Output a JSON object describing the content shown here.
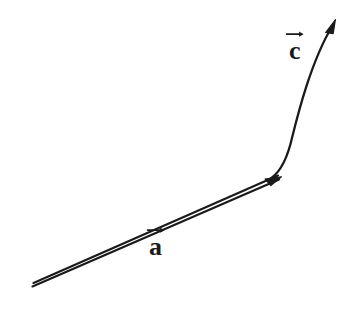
{
  "figure": {
    "background_color": "#ffffff",
    "stroke_color": "#1a1a1a",
    "labels": {
      "vector_a": "a",
      "vector_c": "c",
      "vector_a_full": "a⃗",
      "vector_c_full": "c⃗"
    },
    "icons": {
      "overarrow_a": "vector-overarrow-icon",
      "overarrow_c": "vector-overarrow-icon",
      "arrowhead_a": "arrowhead-icon",
      "arrowhead_c": "arrowhead-icon"
    },
    "geometry": {
      "vector_a": {
        "style": "double-line",
        "tail": [
          32,
          286
        ],
        "head": [
          279,
          178
        ],
        "line_gap_px": 4,
        "stroke_width_px": 2.1
      },
      "vector_c": {
        "style": "single-curved-line",
        "tail": [
          270,
          176
        ],
        "head": [
          335,
          22
        ],
        "control_point": [
          290,
          120
        ],
        "stroke_width_px": 2.3
      }
    }
  }
}
